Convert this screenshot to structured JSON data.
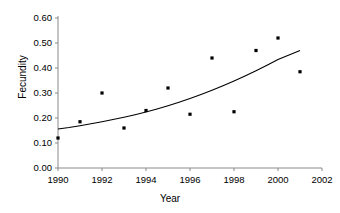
{
  "chart_data": {
    "type": "scatter",
    "title": "",
    "xlabel": "Year",
    "ylabel": "Fecundity",
    "xlim": [
      1990,
      2002
    ],
    "ylim": [
      0.0,
      0.6
    ],
    "grid": false,
    "legend": null,
    "x_ticks": [
      "1990",
      "1992",
      "1994",
      "1996",
      "1998",
      "2000",
      "2002"
    ],
    "x_tick_values": [
      1990,
      1992,
      1994,
      1996,
      1998,
      2000,
      2002
    ],
    "y_ticks": [
      "0.00",
      "0.10",
      "0.20",
      "0.30",
      "0.40",
      "0.50",
      "0.60"
    ],
    "y_tick_values": [
      0.0,
      0.1,
      0.2,
      0.3,
      0.4,
      0.5,
      0.6
    ],
    "x": [
      1990,
      1991,
      1992,
      1993,
      1994,
      1995,
      1996,
      1997,
      1998,
      1999,
      2000,
      2001
    ],
    "values": [
      0.12,
      0.185,
      0.3,
      0.16,
      0.23,
      0.32,
      0.215,
      0.44,
      0.225,
      0.47,
      0.52,
      0.385
    ],
    "series": [
      {
        "name": "Fecundity observations",
        "type": "scatter",
        "marker": "square",
        "color": "#000000",
        "points": [
          {
            "x": 1990,
            "y": 0.12
          },
          {
            "x": 1991,
            "y": 0.185
          },
          {
            "x": 1992,
            "y": 0.3
          },
          {
            "x": 1993,
            "y": 0.16
          },
          {
            "x": 1994,
            "y": 0.23
          },
          {
            "x": 1995,
            "y": 0.32
          },
          {
            "x": 1996,
            "y": 0.215
          },
          {
            "x": 1997,
            "y": 0.44
          },
          {
            "x": 1998,
            "y": 0.225
          },
          {
            "x": 1999,
            "y": 0.47
          },
          {
            "x": 2000,
            "y": 0.52
          },
          {
            "x": 2001,
            "y": 0.385
          }
        ]
      },
      {
        "name": "Fitted trend curve",
        "type": "line",
        "color": "#000000",
        "points": [
          {
            "x": 1990.0,
            "y": 0.156
          },
          {
            "x": 1990.5,
            "y": 0.162
          },
          {
            "x": 1991.0,
            "y": 0.169
          },
          {
            "x": 1991.5,
            "y": 0.177
          },
          {
            "x": 1992.0,
            "y": 0.185
          },
          {
            "x": 1992.5,
            "y": 0.194
          },
          {
            "x": 1993.0,
            "y": 0.203
          },
          {
            "x": 1993.5,
            "y": 0.213
          },
          {
            "x": 1994.0,
            "y": 0.224
          },
          {
            "x": 1994.5,
            "y": 0.236
          },
          {
            "x": 1995.0,
            "y": 0.249
          },
          {
            "x": 1995.5,
            "y": 0.263
          },
          {
            "x": 1996.0,
            "y": 0.278
          },
          {
            "x": 1996.5,
            "y": 0.294
          },
          {
            "x": 1997.0,
            "y": 0.311
          },
          {
            "x": 1997.5,
            "y": 0.329
          },
          {
            "x": 1998.0,
            "y": 0.348
          },
          {
            "x": 1998.5,
            "y": 0.368
          },
          {
            "x": 1999.0,
            "y": 0.389
          },
          {
            "x": 1999.5,
            "y": 0.411
          },
          {
            "x": 2000.0,
            "y": 0.434
          },
          {
            "x": 2000.5,
            "y": 0.452
          },
          {
            "x": 2001.0,
            "y": 0.47
          }
        ]
      }
    ]
  }
}
